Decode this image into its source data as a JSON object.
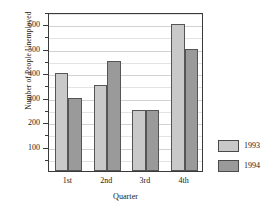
{
  "chart_data": {
    "type": "bar",
    "title": "",
    "subtitle": "",
    "xlabel": "Quarter",
    "ylabel": "Number of People Unemployed",
    "categories": [
      "1st",
      "2nd",
      "3rd",
      "4th"
    ],
    "series": [
      {
        "name": "1993",
        "color": "#c9c9c9",
        "values": [
          400,
          350,
          250,
          600
        ]
      },
      {
        "name": "1994",
        "color": "#9a9a9a",
        "values": [
          300,
          450,
          250,
          500
        ]
      }
    ],
    "ylim": [
      0,
      650
    ],
    "y_major_ticks": [
      100,
      200,
      300,
      400,
      500,
      600
    ],
    "y_minor_ticks": [
      50,
      150,
      250,
      350,
      450,
      550,
      650
    ],
    "y_tick_labels": [
      "100",
      "200",
      "300",
      "400",
      "500",
      "600"
    ],
    "grid": true,
    "grid_axis": "y",
    "legend_position": "right",
    "bar_outline_color": "#555555",
    "frame": true
  },
  "legend": {
    "entries": [
      {
        "label": "1993"
      },
      {
        "label": "1994"
      }
    ]
  }
}
